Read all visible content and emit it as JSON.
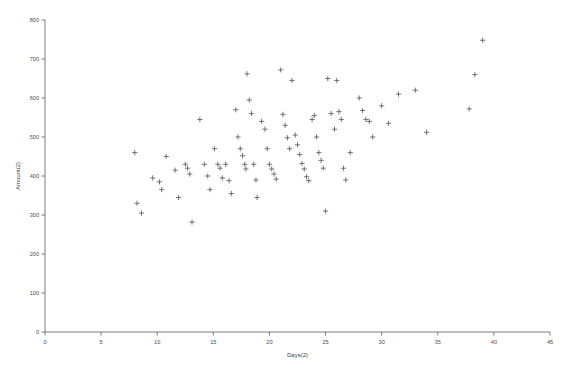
{
  "chart": {
    "title": "",
    "background_color": "#ffffff",
    "axis_color": "#5a5a62",
    "marker_color": "#5b5b64",
    "marker_symbol": "+"
  },
  "chart_data": {
    "type": "scatter",
    "title": "",
    "xlabel": "Days(2)",
    "ylabel": "Amount(2)",
    "xlim": [
      0,
      45
    ],
    "ylim": [
      0,
      800
    ],
    "xticks": [
      0,
      5,
      10,
      15,
      20,
      25,
      30,
      35,
      40,
      45
    ],
    "yticks": [
      0,
      100,
      200,
      300,
      400,
      500,
      600,
      700,
      800
    ],
    "xtick_labels": [
      "0",
      "5",
      "10",
      "15",
      "20",
      "25",
      "30",
      "35",
      "40",
      "45"
    ],
    "ytick_labels": [
      "0",
      "100",
      "200",
      "300",
      "400",
      "500",
      "600",
      "700",
      "800"
    ],
    "grid": false,
    "legend": false,
    "marker": "+",
    "series": [
      {
        "name": "Amount(2) vs Days(2)",
        "points": [
          [
            8.0,
            460
          ],
          [
            8.2,
            330
          ],
          [
            8.6,
            305
          ],
          [
            9.6,
            395
          ],
          [
            10.2,
            385
          ],
          [
            10.4,
            365
          ],
          [
            10.8,
            450
          ],
          [
            11.6,
            415
          ],
          [
            11.9,
            345
          ],
          [
            12.5,
            430
          ],
          [
            12.7,
            420
          ],
          [
            12.9,
            405
          ],
          [
            13.1,
            282
          ],
          [
            13.8,
            545
          ],
          [
            14.2,
            430
          ],
          [
            14.5,
            400
          ],
          [
            14.7,
            365
          ],
          [
            15.1,
            470
          ],
          [
            15.4,
            430
          ],
          [
            15.6,
            420
          ],
          [
            15.8,
            395
          ],
          [
            16.1,
            430
          ],
          [
            16.4,
            388
          ],
          [
            16.6,
            355
          ],
          [
            17.0,
            570
          ],
          [
            17.2,
            500
          ],
          [
            17.4,
            470
          ],
          [
            17.6,
            452
          ],
          [
            17.8,
            430
          ],
          [
            17.9,
            418
          ],
          [
            18.0,
            662
          ],
          [
            18.2,
            595
          ],
          [
            18.4,
            560
          ],
          [
            18.6,
            430
          ],
          [
            18.8,
            390
          ],
          [
            18.9,
            345
          ],
          [
            19.3,
            540
          ],
          [
            19.6,
            520
          ],
          [
            19.8,
            470
          ],
          [
            20.0,
            430
          ],
          [
            20.2,
            418
          ],
          [
            20.4,
            405
          ],
          [
            20.6,
            392
          ],
          [
            21.0,
            672
          ],
          [
            21.2,
            558
          ],
          [
            21.4,
            530
          ],
          [
            21.6,
            498
          ],
          [
            21.8,
            470
          ],
          [
            22.0,
            645
          ],
          [
            22.3,
            505
          ],
          [
            22.5,
            480
          ],
          [
            22.7,
            455
          ],
          [
            22.9,
            432
          ],
          [
            23.1,
            418
          ],
          [
            23.3,
            398
          ],
          [
            23.5,
            388
          ],
          [
            23.8,
            545
          ],
          [
            24.0,
            555
          ],
          [
            24.2,
            500
          ],
          [
            24.4,
            460
          ],
          [
            24.6,
            440
          ],
          [
            24.8,
            420
          ],
          [
            25.0,
            310
          ],
          [
            25.2,
            650
          ],
          [
            25.5,
            560
          ],
          [
            25.8,
            520
          ],
          [
            26.0,
            645
          ],
          [
            26.2,
            565
          ],
          [
            26.4,
            545
          ],
          [
            26.6,
            420
          ],
          [
            26.8,
            390
          ],
          [
            27.2,
            460
          ],
          [
            28.0,
            600
          ],
          [
            28.3,
            568
          ],
          [
            28.6,
            545
          ],
          [
            28.9,
            540
          ],
          [
            29.2,
            500
          ],
          [
            30.0,
            580
          ],
          [
            30.6,
            535
          ],
          [
            31.5,
            610
          ],
          [
            33.0,
            620
          ],
          [
            34.0,
            512
          ],
          [
            37.8,
            572
          ],
          [
            38.3,
            660
          ],
          [
            39.0,
            748
          ]
        ]
      }
    ]
  }
}
